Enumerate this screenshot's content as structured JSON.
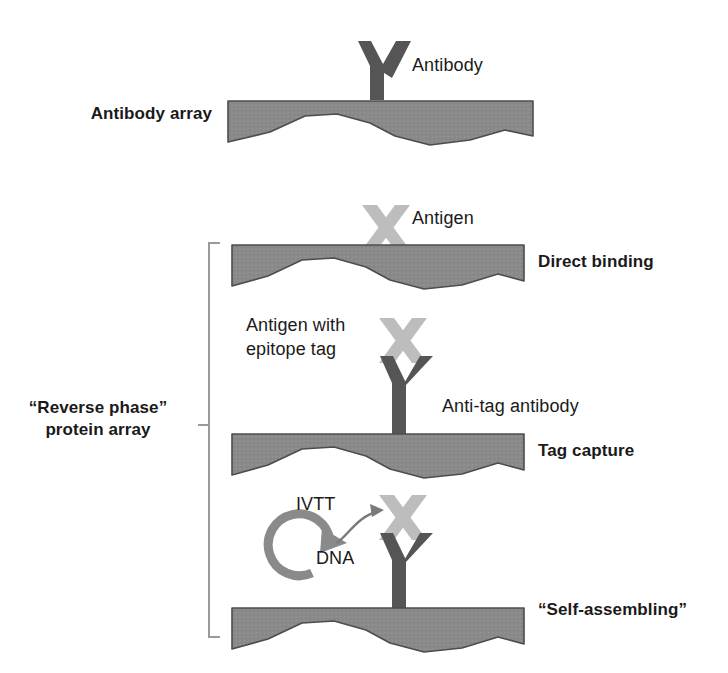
{
  "figure": {
    "width": 728,
    "height": 673,
    "background": "#ffffff"
  },
  "colors": {
    "slab_fill": "#8a8a8a",
    "slab_stroke": "#4d4d4d",
    "antibody_dark": "#555555",
    "antigen_light": "#bdbdbd",
    "dna_circle": "#8a8a8a",
    "arrow": "#7a7a7a",
    "bracket": "#9a9a9a",
    "text": "#1a1a1a"
  },
  "panels": [
    {
      "id": "antibody-array",
      "group_label": "Antibody array",
      "right_label": "",
      "molecules": [
        "antibody"
      ]
    },
    {
      "id": "direct-binding",
      "group_label": "",
      "right_label": "Direct binding",
      "molecules": [
        "antigen"
      ]
    },
    {
      "id": "tag-capture",
      "group_label": "",
      "right_label": "Tag capture",
      "molecules": [
        "antigen",
        "antibody"
      ]
    },
    {
      "id": "self-assembling",
      "group_label": "",
      "right_label": "“Self-assembling”",
      "molecules": [
        "antigen",
        "antibody",
        "dna"
      ]
    }
  ],
  "labels": {
    "antibody_array": "Antibody array",
    "antibody": "Antibody",
    "antigen": "Antigen",
    "direct_binding": "Direct binding",
    "antigen_with_epitope_tag_line1": "Antigen with",
    "antigen_with_epitope_tag_line2": "epitope tag",
    "anti_tag_antibody": "Anti-tag antibody",
    "tag_capture": "Tag capture",
    "ivtt": "IVTT",
    "dna": "DNA",
    "self_assembling": "“Self-assembling”",
    "reverse_phase_line1": "“Reverse phase”",
    "reverse_phase_line2": "protein array"
  }
}
